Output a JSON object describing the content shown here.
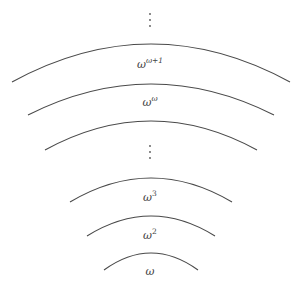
{
  "diagram": {
    "type": "nested-arcs",
    "stroke_color": "#4a4a4a",
    "arcs": [
      {
        "id": "omega-omega-plus-1",
        "x1": 12,
        "y1": 82,
        "x2": 290,
        "y2": 82,
        "apex_y": 44,
        "label_base": "ω",
        "label_exp": "ω+1",
        "label_x": 150,
        "label_y": 64
      },
      {
        "id": "omega-omega",
        "x1": 28,
        "y1": 115,
        "x2": 274,
        "y2": 115,
        "apex_y": 84,
        "label_base": "ω",
        "label_exp": "ω",
        "label_x": 150,
        "label_y": 102
      },
      {
        "id": "unlabeled",
        "x1": 45,
        "y1": 150,
        "x2": 257,
        "y2": 150,
        "apex_y": 121,
        "label_base": "",
        "label_exp": ""
      },
      {
        "id": "omega-cubed",
        "x1": 70,
        "y1": 202,
        "x2": 232,
        "y2": 202,
        "apex_y": 178,
        "label_base": "ω",
        "label_exp": "3",
        "label_x": 150,
        "label_y": 197
      },
      {
        "id": "omega-squared",
        "x1": 87,
        "y1": 236,
        "x2": 215,
        "y2": 236,
        "apex_y": 216,
        "label_base": "ω",
        "label_exp": "2",
        "label_x": 150,
        "label_y": 235
      },
      {
        "id": "omega",
        "x1": 104,
        "y1": 270,
        "x2": 198,
        "y2": 270,
        "apex_y": 253,
        "label_base": "ω",
        "label_exp": "",
        "label_x": 150,
        "label_y": 271
      }
    ],
    "ellipses": [
      {
        "id": "top-vdots",
        "x": 150,
        "ys": [
          14,
          20,
          26
        ],
        "symbol": "⋮"
      },
      {
        "id": "middle-vdots",
        "x": 150,
        "ys": [
          146,
          152,
          158
        ],
        "symbol": "⋮"
      }
    ],
    "labels": {
      "omega_omega_plus_1": {
        "base": "ω",
        "exp": "ω+1"
      },
      "omega_omega": {
        "base": "ω",
        "exp": "ω"
      },
      "omega_cubed": {
        "base": "ω",
        "exp": "3"
      },
      "omega_squared": {
        "base": "ω",
        "exp": "2"
      },
      "omega": {
        "base": "ω",
        "exp": ""
      }
    }
  }
}
